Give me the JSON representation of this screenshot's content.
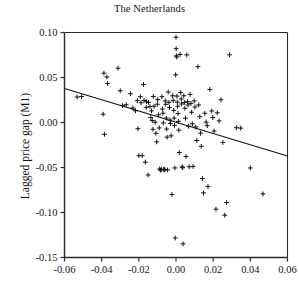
{
  "chart_data": {
    "type": "scatter",
    "title": "The Netherlands",
    "xlabel": "",
    "ylabel": "Lagged price gap (M1)",
    "xlim": [
      -0.06,
      0.06
    ],
    "ylim": [
      -0.15,
      0.1
    ],
    "grid": false,
    "legend": null,
    "xticks": [
      -0.06,
      -0.04,
      -0.02,
      0.0,
      0.02,
      0.04,
      0.06
    ],
    "xtick_labels": [
      "-0.06",
      "-0.04",
      "-0.02",
      "0.00",
      "0.02",
      "0.04",
      "0.06"
    ],
    "yticks": [
      0.1,
      0.05,
      0.0,
      -0.05,
      -0.1,
      -0.15
    ],
    "ytick_labels": [
      "0.10",
      "0.05",
      "0.00",
      "-0.05",
      "-0.10",
      "-0.15"
    ],
    "marker": "plus",
    "marker_color": "#121212",
    "fit_line": {
      "x": [
        -0.06,
        0.06
      ],
      "y": [
        0.0378,
        -0.0372
      ],
      "slope": -0.625,
      "intercept": 0.0003,
      "color": "#121212"
    },
    "points": [
      {
        "x": -0.0532,
        "y": 0.0283
      },
      {
        "x": -0.0508,
        "y": 0.0288
      },
      {
        "x": -0.0388,
        "y": 0.0548
      },
      {
        "x": -0.0372,
        "y": 0.0506
      },
      {
        "x": -0.0368,
        "y": 0.0433
      },
      {
        "x": -0.0392,
        "y": 0.0092
      },
      {
        "x": -0.0385,
        "y": -0.0131
      },
      {
        "x": -0.0312,
        "y": 0.0603
      },
      {
        "x": -0.03,
        "y": 0.0353
      },
      {
        "x": -0.0288,
        "y": 0.0188
      },
      {
        "x": -0.0268,
        "y": 0.0198
      },
      {
        "x": -0.0245,
        "y": 0.032
      },
      {
        "x": -0.0232,
        "y": 0.0161
      },
      {
        "x": -0.0218,
        "y": 0.013
      },
      {
        "x": -0.0208,
        "y": 0.0243
      },
      {
        "x": -0.0205,
        "y": -0.0069
      },
      {
        "x": -0.02,
        "y": -0.0368
      },
      {
        "x": -0.0192,
        "y": 0.0287
      },
      {
        "x": -0.0188,
        "y": 0.0219
      },
      {
        "x": -0.0182,
        "y": -0.0369
      },
      {
        "x": -0.0175,
        "y": 0.0423
      },
      {
        "x": -0.0172,
        "y": 0.0245
      },
      {
        "x": -0.0165,
        "y": -0.0441
      },
      {
        "x": -0.016,
        "y": 0.0168
      },
      {
        "x": -0.0158,
        "y": 0.0231
      },
      {
        "x": -0.015,
        "y": -0.0583
      },
      {
        "x": -0.0148,
        "y": 0.0224
      },
      {
        "x": -0.014,
        "y": 0.0177
      },
      {
        "x": -0.0136,
        "y": 0.0055
      },
      {
        "x": -0.0132,
        "y": 0.0129
      },
      {
        "x": -0.0128,
        "y": 0.0022
      },
      {
        "x": -0.0124,
        "y": -0.0075
      },
      {
        "x": -0.0122,
        "y": 0.0289
      },
      {
        "x": -0.0118,
        "y": 0.0181
      },
      {
        "x": -0.0112,
        "y": 0.0003
      },
      {
        "x": -0.0108,
        "y": -0.012
      },
      {
        "x": -0.0104,
        "y": -0.0215
      },
      {
        "x": -0.01,
        "y": 0.0203
      },
      {
        "x": -0.0098,
        "y": 0.0255
      },
      {
        "x": -0.0094,
        "y": 0.0086
      },
      {
        "x": -0.009,
        "y": -0.006
      },
      {
        "x": -0.0088,
        "y": -0.0516
      },
      {
        "x": -0.0083,
        "y": -0.0529
      },
      {
        "x": -0.0079,
        "y": -0.0521
      },
      {
        "x": -0.0076,
        "y": 0.0287
      },
      {
        "x": -0.0073,
        "y": 0.015
      },
      {
        "x": -0.007,
        "y": 0.0103
      },
      {
        "x": -0.0068,
        "y": -0.0005
      },
      {
        "x": -0.0066,
        "y": -0.052
      },
      {
        "x": -0.0063,
        "y": -0.0525
      },
      {
        "x": -0.006,
        "y": -0.0523
      },
      {
        "x": -0.0058,
        "y": 0.024
      },
      {
        "x": -0.0055,
        "y": 0.0202
      },
      {
        "x": -0.0052,
        "y": 0.0049
      },
      {
        "x": -0.005,
        "y": -0.0073
      },
      {
        "x": -0.0048,
        "y": -0.0163
      },
      {
        "x": -0.0045,
        "y": -0.0527
      },
      {
        "x": -0.0042,
        "y": 0.0338
      },
      {
        "x": -0.0038,
        "y": 0.0224
      },
      {
        "x": -0.0035,
        "y": 0.0166
      },
      {
        "x": -0.0032,
        "y": 0.0027
      },
      {
        "x": -0.003,
        "y": -0.0011
      },
      {
        "x": -0.0026,
        "y": -0.0148
      },
      {
        "x": -0.0022,
        "y": -0.08
      },
      {
        "x": -0.0018,
        "y": 0.0297
      },
      {
        "x": -0.0015,
        "y": 0.0243
      },
      {
        "x": -0.0012,
        "y": 0.0135
      },
      {
        "x": -0.001,
        "y": 0.0049
      },
      {
        "x": -0.0008,
        "y": -0.0032
      },
      {
        "x": -0.0006,
        "y": -0.0505
      },
      {
        "x": -0.0004,
        "y": -0.1283
      },
      {
        "x": -0.0002,
        "y": 0.053
      },
      {
        "x": 0.0,
        "y": 0.0948
      },
      {
        "x": 0.0001,
        "y": 0.082
      },
      {
        "x": 0.0002,
        "y": 0.074
      },
      {
        "x": 0.0004,
        "y": 0.0728
      },
      {
        "x": 0.0005,
        "y": 0.0293
      },
      {
        "x": 0.0007,
        "y": 0.0226
      },
      {
        "x": 0.0009,
        "y": 0.018
      },
      {
        "x": 0.0011,
        "y": 0.01
      },
      {
        "x": 0.0013,
        "y": 0.0013
      },
      {
        "x": 0.0015,
        "y": -0.0085
      },
      {
        "x": 0.0018,
        "y": -0.0334
      },
      {
        "x": 0.0022,
        "y": 0.0756
      },
      {
        "x": 0.0025,
        "y": 0.0333
      },
      {
        "x": 0.0028,
        "y": 0.0261
      },
      {
        "x": 0.003,
        "y": 0.0206
      },
      {
        "x": 0.0033,
        "y": -0.0493
      },
      {
        "x": 0.0036,
        "y": -0.0502
      },
      {
        "x": 0.0038,
        "y": -0.1348
      },
      {
        "x": 0.0042,
        "y": 0.0297
      },
      {
        "x": 0.0045,
        "y": 0.0222
      },
      {
        "x": 0.0048,
        "y": 0.0158
      },
      {
        "x": 0.0051,
        "y": 0.0048
      },
      {
        "x": 0.0054,
        "y": -0.0378
      },
      {
        "x": 0.0058,
        "y": 0.0751
      },
      {
        "x": 0.0062,
        "y": 0.0232
      },
      {
        "x": 0.0065,
        "y": 0.0195
      },
      {
        "x": 0.0068,
        "y": -0.0042
      },
      {
        "x": 0.0071,
        "y": -0.0492
      },
      {
        "x": 0.0076,
        "y": 0.0312
      },
      {
        "x": 0.008,
        "y": 0.0212
      },
      {
        "x": 0.0084,
        "y": 0.0114
      },
      {
        "x": 0.0088,
        "y": -0.0014
      },
      {
        "x": 0.0092,
        "y": -0.0488
      },
      {
        "x": 0.0098,
        "y": 0.024
      },
      {
        "x": 0.0102,
        "y": 0.0172
      },
      {
        "x": 0.0106,
        "y": -0.005
      },
      {
        "x": 0.0112,
        "y": -0.02
      },
      {
        "x": 0.0118,
        "y": 0.062
      },
      {
        "x": 0.0122,
        "y": 0.0195
      },
      {
        "x": 0.0128,
        "y": 0.0064
      },
      {
        "x": 0.0132,
        "y": -0.0118
      },
      {
        "x": 0.0136,
        "y": -0.0265
      },
      {
        "x": 0.0142,
        "y": -0.0623
      },
      {
        "x": 0.0148,
        "y": -0.0782
      },
      {
        "x": 0.0155,
        "y": 0.0102
      },
      {
        "x": 0.0162,
        "y": 0.0005
      },
      {
        "x": 0.0168,
        "y": -0.0035
      },
      {
        "x": 0.0172,
        "y": -0.0712
      },
      {
        "x": 0.0182,
        "y": 0.0367
      },
      {
        "x": 0.0192,
        "y": 0.0128
      },
      {
        "x": 0.0198,
        "y": 0.0055
      },
      {
        "x": 0.0205,
        "y": -0.0095
      },
      {
        "x": 0.0215,
        "y": -0.0963
      },
      {
        "x": 0.0222,
        "y": 0.0108
      },
      {
        "x": 0.0232,
        "y": 0.0018
      },
      {
        "x": 0.0242,
        "y": 0.0253
      },
      {
        "x": 0.0252,
        "y": -0.0222
      },
      {
        "x": 0.0262,
        "y": -0.103
      },
      {
        "x": 0.0272,
        "y": -0.089
      },
      {
        "x": 0.0288,
        "y": 0.0752
      },
      {
        "x": 0.0325,
        "y": -0.0058
      },
      {
        "x": 0.0348,
        "y": -0.0062
      },
      {
        "x": 0.04,
        "y": -0.0505
      },
      {
        "x": 0.0468,
        "y": -0.0793
      }
    ]
  }
}
